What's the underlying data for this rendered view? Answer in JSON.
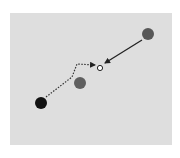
{
  "diagram": {
    "panel": {
      "x": 10,
      "y": 13,
      "width": 162,
      "height": 132,
      "fill": "#dedede"
    },
    "nodes": [
      {
        "id": "top-right-dot",
        "cx": 148,
        "cy": 34,
        "r": 6,
        "fill": "#575757"
      },
      {
        "id": "middle-dot",
        "cx": 80,
        "cy": 83,
        "r": 6,
        "fill": "#5f5f5f"
      },
      {
        "id": "black-dot",
        "cx": 41,
        "cy": 103,
        "r": 6,
        "fill": "#111111"
      },
      {
        "id": "target-hollow-dot",
        "cx": 100,
        "cy": 68,
        "r": 2.6,
        "fill": "#ffffff",
        "stroke": "#222222"
      }
    ],
    "arrows": [
      {
        "id": "solid-arrow",
        "style": "solid",
        "points": "142,40 105,63",
        "color": "#222222"
      },
      {
        "id": "dotted-arrow",
        "style": "dotted",
        "points": "46,97 72,77 77,64 95,65",
        "color": "#333333"
      }
    ]
  }
}
